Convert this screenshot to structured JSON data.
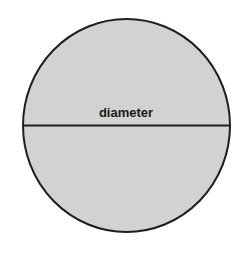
{
  "diagram": {
    "shape": "circle",
    "label": "diameter",
    "colors": {
      "fill": "#d2d2d2",
      "stroke": "#1e1e1e",
      "background": "#ffffff"
    }
  }
}
